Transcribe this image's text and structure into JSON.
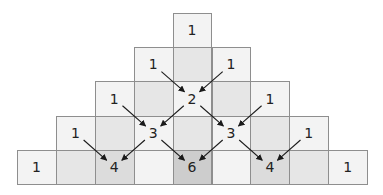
{
  "colors": {
    "border": "#8e8e8e",
    "light": "#f3f3f3",
    "medium": "#e6e6e6",
    "dark": "#dcdcdc",
    "darkest": "#cdcdcd",
    "arrow": "#1a1a1a",
    "text": "#222222"
  },
  "grid": {
    "x0": 17,
    "y0": 13,
    "cell_w": 38.9,
    "cell_h": 34.2
  },
  "rows": [
    {
      "cells": [
        {
          "col": 4,
          "shade": "light"
        }
      ]
    },
    {
      "cells": [
        {
          "col": 3,
          "shade": "light"
        },
        {
          "col": 4,
          "shade": "medium"
        },
        {
          "col": 5,
          "shade": "light"
        }
      ]
    },
    {
      "cells": [
        {
          "col": 2,
          "shade": "light"
        },
        {
          "col": 3,
          "shade": "medium"
        },
        {
          "col": 4,
          "shade": "light"
        },
        {
          "col": 5,
          "shade": "medium"
        },
        {
          "col": 6,
          "shade": "light"
        }
      ]
    },
    {
      "cells": [
        {
          "col": 1,
          "shade": "light"
        },
        {
          "col": 2,
          "shade": "medium"
        },
        {
          "col": 3,
          "shade": "light"
        },
        {
          "col": 4,
          "shade": "medium"
        },
        {
          "col": 5,
          "shade": "light"
        },
        {
          "col": 6,
          "shade": "medium"
        },
        {
          "col": 7,
          "shade": "light"
        }
      ]
    },
    {
      "cells": [
        {
          "col": 0,
          "shade": "light"
        },
        {
          "col": 1,
          "shade": "medium"
        },
        {
          "col": 2,
          "shade": "dark"
        },
        {
          "col": 3,
          "shade": "light"
        },
        {
          "col": 4,
          "shade": "darkest"
        },
        {
          "col": 5,
          "shade": "light"
        },
        {
          "col": 6,
          "shade": "dark"
        },
        {
          "col": 7,
          "shade": "medium"
        },
        {
          "col": 8,
          "shade": "light"
        }
      ]
    }
  ],
  "numbers": [
    {
      "row": 0,
      "col": 4,
      "value": "1"
    },
    {
      "row": 1,
      "col": 3,
      "value": "1"
    },
    {
      "row": 1,
      "col": 5,
      "value": "1"
    },
    {
      "row": 2,
      "col": 2,
      "value": "1"
    },
    {
      "row": 2,
      "col": 4,
      "value": "2"
    },
    {
      "row": 2,
      "col": 6,
      "value": "1"
    },
    {
      "row": 3,
      "col": 1,
      "value": "1"
    },
    {
      "row": 3,
      "col": 3,
      "value": "3"
    },
    {
      "row": 3,
      "col": 5,
      "value": "3"
    },
    {
      "row": 3,
      "col": 7,
      "value": "1"
    },
    {
      "row": 4,
      "col": 0,
      "value": "1"
    },
    {
      "row": 4,
      "col": 2,
      "value": "4"
    },
    {
      "row": 4,
      "col": 4,
      "value": "6"
    },
    {
      "row": 4,
      "col": 6,
      "value": "4"
    },
    {
      "row": 4,
      "col": 8,
      "value": "1"
    }
  ],
  "arrows": [
    {
      "from": [
        1,
        3
      ],
      "to": [
        2,
        4
      ]
    },
    {
      "from": [
        1,
        5
      ],
      "to": [
        2,
        4
      ]
    },
    {
      "from": [
        2,
        2
      ],
      "to": [
        3,
        3
      ]
    },
    {
      "from": [
        2,
        4
      ],
      "to": [
        3,
        3
      ]
    },
    {
      "from": [
        2,
        4
      ],
      "to": [
        3,
        5
      ]
    },
    {
      "from": [
        2,
        6
      ],
      "to": [
        3,
        5
      ]
    },
    {
      "from": [
        3,
        1
      ],
      "to": [
        4,
        2
      ]
    },
    {
      "from": [
        3,
        3
      ],
      "to": [
        4,
        2
      ]
    },
    {
      "from": [
        3,
        3
      ],
      "to": [
        4,
        4
      ]
    },
    {
      "from": [
        3,
        5
      ],
      "to": [
        4,
        4
      ]
    },
    {
      "from": [
        3,
        5
      ],
      "to": [
        4,
        6
      ]
    },
    {
      "from": [
        3,
        7
      ],
      "to": [
        4,
        6
      ]
    }
  ]
}
